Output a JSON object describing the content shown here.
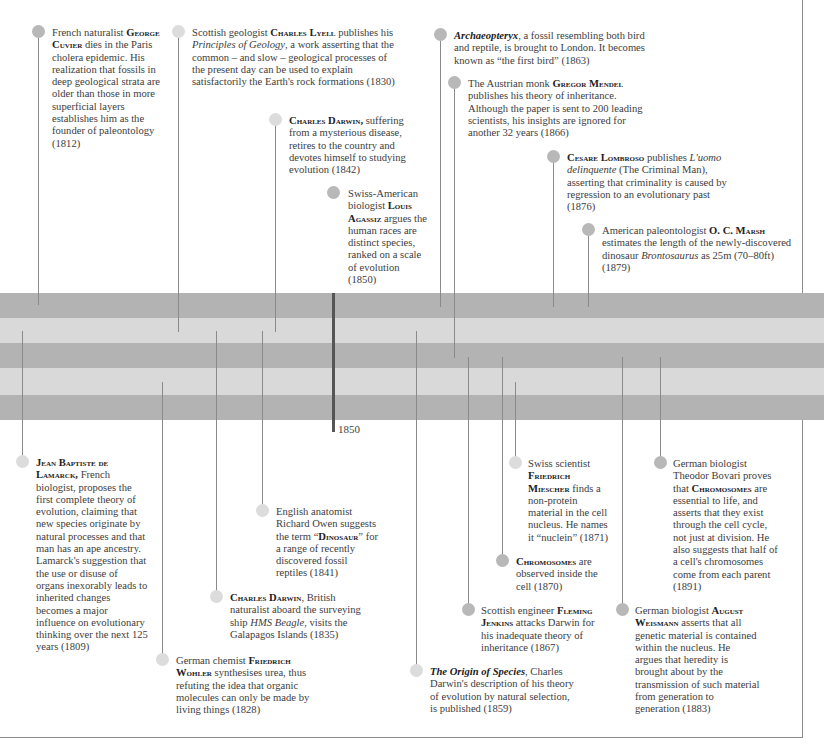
{
  "timeline": {
    "marker_label": "1850",
    "bands": [
      {
        "tone": "dark",
        "top": 293,
        "height": 25
      },
      {
        "tone": "light",
        "top": 318,
        "height": 25
      },
      {
        "tone": "dark",
        "top": 343,
        "height": 25
      },
      {
        "tone": "light",
        "top": 368,
        "height": 27
      },
      {
        "tone": "dark",
        "top": 395,
        "height": 25
      }
    ],
    "colors": {
      "band_dark": "#b3b3b3",
      "band_light": "#d9d9d9",
      "stem": "#8a8a8a",
      "dot": "#b8b8b8",
      "dot_pale": "#dcdcdc",
      "marker": "#555555"
    }
  },
  "events_above": [
    {
      "id": "cuvier",
      "year": "1812",
      "pre": "French naturalist",
      "name": "George Cuvier",
      "post": "dies in the Paris cholera epidemic. His realization that fossils in deep geological strata are older than those in more superficial layers establishes him as the founder of paleontology (1812)"
    },
    {
      "id": "lyell",
      "year": "1830",
      "pre": "Scottish geologist",
      "name": "Charles Lyell",
      "mid": "publishes his",
      "title": "Principles of Geology",
      "post": ", a work asserting that the common – and slow – geological processes of the present day can be used to explain satisfactorily the Earth's rock formations (1830)"
    },
    {
      "id": "darwin1842",
      "year": "1842",
      "name": "Charles Darwin,",
      "post": "suffering from a mysterious disease, retires to the country and devotes himself to studying evolution (1842)"
    },
    {
      "id": "agassiz",
      "year": "1850",
      "pre": "Swiss-American biologist",
      "name": "Louis Agassiz",
      "post": "argues the human races are distinct species, ranked on a scale of evolution (1850)"
    },
    {
      "id": "archaeopteryx",
      "year": "1863",
      "title": "Archaeopteryx",
      "post": ", a fossil resembling both bird and reptile, is brought to London. It becomes known as “the first bird” (1863)"
    },
    {
      "id": "mendel",
      "year": "1866",
      "pre": "The Austrian monk",
      "name": "Gregor Mendel",
      "post": "publishes his theory of inheritance. Although the paper is sent to 200 leading scientists, his insights are ignored for another 32 years (1866)"
    },
    {
      "id": "lombroso",
      "year": "1876",
      "name": "Cesare Lombroso",
      "mid": "publishes",
      "title": "L'uomo delinquente",
      "post": "(The Criminal Man), asserting that criminality is caused by regression to an evolutionary past (1876)"
    },
    {
      "id": "marsh",
      "year": "1879",
      "pre": "American paleontologist",
      "name": "O. C. Marsh",
      "mid": "estimates the length of the newly-discovered dinosaur",
      "title": "Brontosaurus",
      "post": "as 25m (70–80ft) (1879)"
    }
  ],
  "events_below": [
    {
      "id": "lamarck",
      "year": "1809",
      "name": "Jean Baptiste de Lamarck,",
      "post": "French biologist, proposes the first complete theory of evolution, claiming that new species originate by natural processes and that man has an ape ancestry. Lamarck's suggestion that the use or disuse of organs inexorably leads to inherited changes becomes a major influence on evolutionary thinking over the next 125 years (1809)"
    },
    {
      "id": "owen",
      "year": "1841",
      "pre": "English anatomist Richard Owen suggests the term “",
      "name": "Dinosaur",
      "post": "” for a range of recently discovered fossil reptiles (1841)"
    },
    {
      "id": "darwin1835",
      "year": "1835",
      "name": "Charles Darwin",
      "mid": ", British naturalist aboard the surveying ship",
      "title": "HMS Beagle",
      "post": ", visits the Galapagos Islands (1835)"
    },
    {
      "id": "wohler",
      "year": "1828",
      "pre": "German chemist",
      "name": "Friedrich Wohler",
      "post": "synthesises urea, thus refuting the idea that organic molecules can only be made by living things (1828)"
    },
    {
      "id": "miescher",
      "year": "1871",
      "pre": "Swiss scientist",
      "name": "Friedrich Miescher",
      "post": "finds a non-protein material in the cell nucleus. He names it “nuclein” (1871)"
    },
    {
      "id": "chromosomes1870",
      "year": "1870",
      "name": "Chromosomes",
      "post": "are observed inside the cell (1870)"
    },
    {
      "id": "jenkins",
      "year": "1867",
      "pre": "Scottish engineer",
      "name": "Fleming Jenkins",
      "post": "attacks Darwin for his inadequate theory of inheritance (1867)"
    },
    {
      "id": "origin",
      "year": "1859",
      "title": "The Origin of Species",
      "post": ", Charles Darwin's description of his theory of evolution by natural selection, is published (1859)"
    },
    {
      "id": "bovari",
      "year": "1891",
      "pre": "German biologist Theodor Bovari proves that",
      "name": "Chromosomes",
      "post": "are essential to life, and asserts that they exist through the cell cycle, not just at division. He also suggests that half of a cell's chromosomes come from each parent (1891)"
    },
    {
      "id": "weismann",
      "year": "1883",
      "pre": "German biologist",
      "name": "August Weismann",
      "post": "asserts that all genetic material is contained within the nucleus. He argues that heredity is brought about by the transmission of such material from generation to generation (1883)"
    }
  ]
}
